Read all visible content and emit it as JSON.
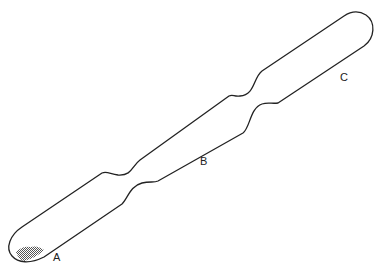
{
  "diagram": {
    "type": "tube-with-constrictions",
    "stroke_color": "#222222",
    "fill_pattern_color": "#555555",
    "labels": [
      {
        "id": "A",
        "text": "A",
        "x": 53,
        "y": 252
      },
      {
        "id": "B",
        "text": "B",
        "x": 200,
        "y": 156
      },
      {
        "id": "C",
        "text": "C",
        "x": 340,
        "y": 72
      }
    ]
  }
}
